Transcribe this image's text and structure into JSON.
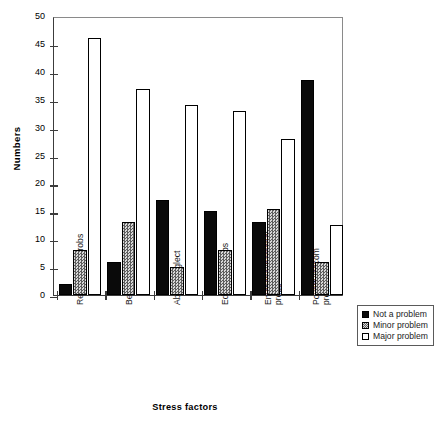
{
  "chart_data": {
    "type": "bar",
    "title": "",
    "xlabel": "Stress factors",
    "ylabel": "Numbers",
    "ylim": [
      0,
      50
    ],
    "yticks": [
      0,
      5,
      10,
      15,
      20,
      25,
      30,
      35,
      40,
      45,
      50
    ],
    "grid": false,
    "legend_position": "right-bottom-outside",
    "categories": [
      "Relationship probs",
      "Behavioural probs",
      "Abuse/neglect",
      "Education probs",
      "Emotional/personal\nprobs",
      "Poverty/accom\nprobs"
    ],
    "series": [
      {
        "name": "Not a problem",
        "values": [
          2,
          6,
          17,
          15,
          13,
          38.5
        ]
      },
      {
        "name": "Minor problem",
        "values": [
          8,
          13,
          5,
          8,
          15.5,
          6
        ]
      },
      {
        "name": "Major problem",
        "values": [
          46,
          37,
          34,
          33,
          28,
          12.5
        ]
      }
    ]
  },
  "axis": {
    "y_title": "Numbers",
    "x_title": "Stress factors",
    "y_tick_labels": [
      "50",
      "45",
      "40",
      "35",
      "30",
      "25",
      "20",
      "15",
      "10",
      "5",
      "0"
    ]
  },
  "legend": {
    "items": [
      {
        "label": "Not a problem"
      },
      {
        "label": "Minor problem"
      },
      {
        "label": "Major problem"
      }
    ]
  }
}
